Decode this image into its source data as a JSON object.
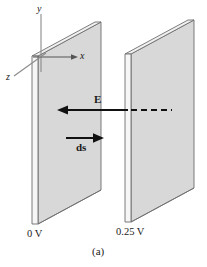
{
  "figure": {
    "caption": "(a)",
    "axes": {
      "y_label": "y",
      "x_label": "x",
      "z_label": "z"
    },
    "vectors": {
      "field_label": "E",
      "displacement_label": "ds"
    },
    "plates": [
      {
        "name": "left-plate",
        "potential_label": "0 V"
      },
      {
        "name": "right-plate",
        "potential_label": "0.25 V"
      }
    ],
    "colors": {
      "plate_face": "#d8d8d8",
      "plate_top": "#ececec",
      "plate_side": "#f4f4f4",
      "outline": "#6e6e6e",
      "arrow": "#111111",
      "axis_line": "#8a8a8a",
      "background": "#ffffff",
      "text": "#1a1a1a"
    }
  }
}
